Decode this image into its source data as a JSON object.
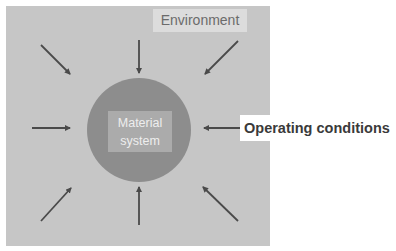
{
  "diagram": {
    "type": "concept-diagram",
    "environment_label": "Environment",
    "core": {
      "line1": "Material",
      "line2": "system"
    },
    "external_label": "Operating conditions",
    "arrows": [
      {
        "direction": "from-top-left",
        "target": "core"
      },
      {
        "direction": "from-top",
        "target": "core"
      },
      {
        "direction": "from-top-right",
        "target": "core"
      },
      {
        "direction": "from-left",
        "target": "core"
      },
      {
        "direction": "from-right",
        "target": "core",
        "source": "Operating conditions"
      },
      {
        "direction": "from-bottom-left",
        "target": "core"
      },
      {
        "direction": "from-bottom",
        "target": "core"
      },
      {
        "direction": "from-bottom-right",
        "target": "core"
      }
    ],
    "colors": {
      "panel": "#c6c6c6",
      "environment_box": "#dcdcdc",
      "circle": "#8d8d8d",
      "core_box": "#ababab",
      "arrow": "#4a4a4a",
      "label_text": "#3a3a3a"
    }
  }
}
